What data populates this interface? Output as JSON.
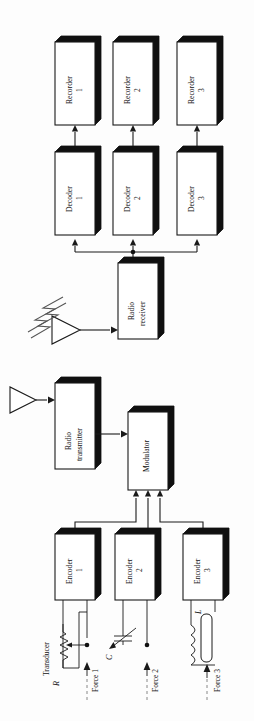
{
  "figure": {
    "kind": "block-diagram",
    "orientation": "rotated-90-ccw",
    "background_color": "#ffffff",
    "line_color": "#1a1a1a",
    "box_shadow_color": "#101010"
  },
  "recorders": [
    {
      "name": "Recorder",
      "index": "1"
    },
    {
      "name": "Recorder",
      "index": "2"
    },
    {
      "name": "Recorder",
      "index": "3"
    }
  ],
  "decoders": [
    {
      "name": "Decoder",
      "index": "1"
    },
    {
      "name": "Decoder",
      "index": "2"
    },
    {
      "name": "Decoder",
      "index": "3"
    }
  ],
  "encoders": [
    {
      "name": "Encoder",
      "index": "1"
    },
    {
      "name": "Encoder",
      "index": "2"
    },
    {
      "name": "Encoder",
      "index": "3"
    }
  ],
  "receiver": {
    "line1": "Radio",
    "line2": "receiver"
  },
  "transmitter": {
    "line1": "Radio",
    "line2": "transmitter"
  },
  "modulator": {
    "label": "Modulator"
  },
  "transducers": [
    {
      "type": "resistor",
      "symbol": "R",
      "caption": "Transducer",
      "force": "Force 1"
    },
    {
      "type": "capacitor",
      "symbol": "C",
      "caption": "",
      "force": "Force 2"
    },
    {
      "type": "inductor",
      "symbol": "L",
      "caption": "",
      "force": "Force 3"
    }
  ],
  "antennas": [
    {
      "name": "transmit-antenna"
    },
    {
      "name": "receive-antenna"
    }
  ],
  "rf_link": {
    "name": "radio-wave-lightning"
  }
}
